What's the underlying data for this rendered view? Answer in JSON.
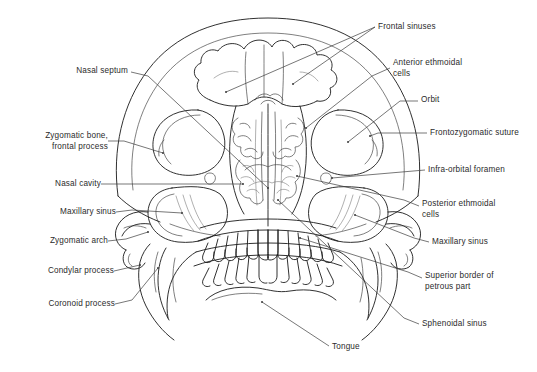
{
  "figure": {
    "kind": "anatomical-line-diagram",
    "background_color": "#ffffff",
    "line_color": "#1a1a1a",
    "text_color": "#2b2b2b"
  },
  "labels": [
    {
      "id": "frontal-sinuses",
      "text": "Frontal sinuses",
      "side": "top-right"
    },
    {
      "id": "anterior-ethmoidal",
      "text": "Anterior ethmoidal\ncells",
      "side": "right"
    },
    {
      "id": "orbit",
      "text": "Orbit",
      "side": "right"
    },
    {
      "id": "frontozygomatic-suture",
      "text": "Frontozygomatic suture",
      "side": "right"
    },
    {
      "id": "infra-orbital-foramen",
      "text": "Infra-orbital foramen",
      "side": "right"
    },
    {
      "id": "posterior-ethmoidal",
      "text": "Posterior ethmoidal\ncells",
      "side": "right"
    },
    {
      "id": "maxillary-sinus-right",
      "text": "Maxillary sinus",
      "side": "right"
    },
    {
      "id": "superior-border-petrous",
      "text": "Superior border of\npetrous part",
      "side": "right"
    },
    {
      "id": "sphenoidal-sinus",
      "text": "Sphenoidal sinus",
      "side": "right"
    },
    {
      "id": "nasal-septum",
      "text": "Nasal septum",
      "side": "left"
    },
    {
      "id": "zygomatic-bone",
      "text": "Zygomatic bone,\nfrontal process",
      "side": "left"
    },
    {
      "id": "nasal-cavity",
      "text": "Nasal cavity",
      "side": "left"
    },
    {
      "id": "maxillary-sinus-left",
      "text": "Maxillary sinus",
      "side": "left"
    },
    {
      "id": "zygomatic-arch",
      "text": "Zygomatic arch",
      "side": "left"
    },
    {
      "id": "condylar-process",
      "text": "Condylar process",
      "side": "left"
    },
    {
      "id": "coronoid-process",
      "text": "Coronoid process",
      "side": "left"
    },
    {
      "id": "tongue",
      "text": "Tongue",
      "side": "bottom"
    }
  ]
}
